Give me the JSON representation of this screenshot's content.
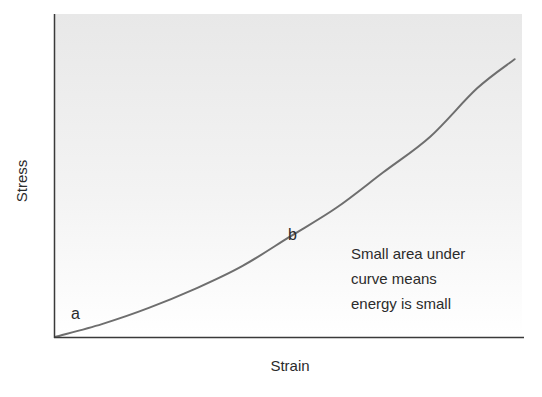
{
  "chart_data": {
    "type": "line",
    "title": "",
    "xlabel": "Strain",
    "ylabel": "Stress",
    "grid": false,
    "legend": null,
    "xlim": [
      0,
      1
    ],
    "ylim": [
      0,
      1
    ],
    "ticks": {
      "x": [],
      "y": []
    },
    "series": [
      {
        "name": "stress-strain curve",
        "color": "#6e6e6e",
        "x": [
          0.0,
          0.1,
          0.2,
          0.3,
          0.4,
          0.5,
          0.6,
          0.7,
          0.8,
          0.9,
          0.98
        ],
        "y": [
          0.0,
          0.04,
          0.09,
          0.15,
          0.22,
          0.31,
          0.4,
          0.51,
          0.62,
          0.77,
          0.86
        ]
      }
    ],
    "point_labels": [
      {
        "text": "a",
        "x": 0.04,
        "y": 0.07
      },
      {
        "text": "b",
        "x": 0.5,
        "y": 0.33
      }
    ],
    "annotations": [
      {
        "lines": [
          "Small area under",
          "curve means",
          "energy is small"
        ],
        "x": 0.63,
        "y": 0.3
      }
    ]
  },
  "colors": {
    "axis": "#3a3a3a",
    "curve": "#6e6e6e",
    "bg_top": "#e8e8e8",
    "bg_bottom": "#ffffff",
    "text": "#2b2b2b"
  },
  "labels": {
    "y_axis": "Stress",
    "x_axis": "Strain",
    "point_a": "a",
    "point_b": "b",
    "annotation": [
      "Small area under",
      "curve means",
      "energy is small"
    ]
  }
}
